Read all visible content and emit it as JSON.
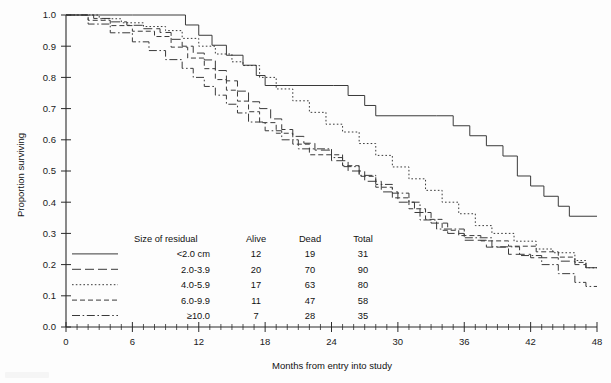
{
  "chart_data": {
    "type": "line",
    "subtype": "kaplan-meier-step",
    "title": "",
    "xlabel": "Months from entry into study",
    "ylabel": "Proportion surviving",
    "xlim": [
      0,
      48
    ],
    "ylim": [
      0.0,
      1.0
    ],
    "xticks": [
      0,
      6,
      12,
      18,
      24,
      30,
      36,
      42,
      48
    ],
    "xtick_labels": [
      "0",
      "6",
      "12",
      "18",
      "24",
      "30",
      "36",
      "42",
      "48"
    ],
    "x_minor_tick_step": 1,
    "yticks": [
      0.0,
      0.1,
      0.2,
      0.3,
      0.4,
      0.5,
      0.6,
      0.7,
      0.8,
      0.9,
      1.0
    ],
    "ytick_labels": [
      "0.0",
      "0.1",
      "0.2",
      "0.3",
      "0.4",
      "0.5",
      "0.6",
      "0.7",
      "0.8",
      "0.9",
      "1.0"
    ],
    "grid": false,
    "legend_position": "inside-lower-left",
    "line_color": "#3a3a3a",
    "background": "#fdfdfd",
    "series": [
      {
        "name": "<2.0 cm",
        "style": "solid",
        "dash": "none",
        "final_value": 0.35,
        "points": [
          [
            0,
            1.0
          ],
          [
            6.0,
            1.0
          ],
          [
            10.8,
            0.968
          ],
          [
            12.0,
            0.935
          ],
          [
            13.2,
            0.903
          ],
          [
            14.5,
            0.871
          ],
          [
            16.0,
            0.839
          ],
          [
            17.2,
            0.806
          ],
          [
            18.0,
            0.774
          ],
          [
            24.2,
            0.774
          ],
          [
            25.5,
            0.742
          ],
          [
            27.0,
            0.71
          ],
          [
            28.0,
            0.677
          ],
          [
            33.5,
            0.677
          ],
          [
            35.0,
            0.645
          ],
          [
            36.5,
            0.613
          ],
          [
            38.0,
            0.581
          ],
          [
            39.5,
            0.548
          ],
          [
            40.8,
            0.484
          ],
          [
            42.0,
            0.452
          ],
          [
            43.2,
            0.419
          ],
          [
            44.5,
            0.387
          ],
          [
            45.5,
            0.355
          ],
          [
            48,
            0.355
          ]
        ]
      },
      {
        "name": "2.0-3.9",
        "style": "long-dash",
        "dash": "9,4",
        "final_value": 0.19,
        "points": [
          [
            0,
            1.0
          ],
          [
            2.5,
            0.989
          ],
          [
            4.0,
            0.978
          ],
          [
            5.5,
            0.967
          ],
          [
            7.0,
            0.956
          ],
          [
            8.5,
            0.944
          ],
          [
            9.5,
            0.922
          ],
          [
            10.5,
            0.9
          ],
          [
            11.5,
            0.878
          ],
          [
            12.5,
            0.856
          ],
          [
            13.5,
            0.822
          ],
          [
            14.5,
            0.789
          ],
          [
            15.5,
            0.756
          ],
          [
            16.5,
            0.722
          ],
          [
            17.5,
            0.7
          ],
          [
            18.5,
            0.667
          ],
          [
            19.5,
            0.633
          ],
          [
            20.5,
            0.611
          ],
          [
            21.5,
            0.589
          ],
          [
            22.5,
            0.567
          ],
          [
            24.0,
            0.533
          ],
          [
            25.5,
            0.5
          ],
          [
            27.0,
            0.467
          ],
          [
            28.5,
            0.433
          ],
          [
            30.0,
            0.4
          ],
          [
            31.5,
            0.367
          ],
          [
            33.0,
            0.333
          ],
          [
            34.5,
            0.3
          ],
          [
            36.0,
            0.278
          ],
          [
            38.0,
            0.256
          ],
          [
            40.0,
            0.233
          ],
          [
            42.0,
            0.222
          ],
          [
            44.5,
            0.211
          ],
          [
            46.0,
            0.2
          ],
          [
            47.0,
            0.19
          ],
          [
            48,
            0.19
          ]
        ]
      },
      {
        "name": "4.0-5.9",
        "style": "dotted",
        "dash": "1.6,2.2",
        "final_value": 0.19,
        "points": [
          [
            0,
            1.0
          ],
          [
            3.0,
            0.988
          ],
          [
            5.0,
            0.975
          ],
          [
            7.0,
            0.963
          ],
          [
            9.0,
            0.95
          ],
          [
            10.5,
            0.925
          ],
          [
            12.0,
            0.9
          ],
          [
            13.5,
            0.875
          ],
          [
            15.0,
            0.85
          ],
          [
            16.0,
            0.838
          ],
          [
            17.5,
            0.8
          ],
          [
            19.0,
            0.763
          ],
          [
            20.5,
            0.725
          ],
          [
            22.0,
            0.688
          ],
          [
            23.5,
            0.65
          ],
          [
            25.0,
            0.625
          ],
          [
            26.5,
            0.588
          ],
          [
            28.0,
            0.55
          ],
          [
            29.5,
            0.513
          ],
          [
            31.0,
            0.475
          ],
          [
            32.5,
            0.438
          ],
          [
            34.0,
            0.4
          ],
          [
            35.5,
            0.363
          ],
          [
            37.0,
            0.325
          ],
          [
            38.5,
            0.3
          ],
          [
            40.5,
            0.275
          ],
          [
            42.5,
            0.25
          ],
          [
            44.0,
            0.238
          ],
          [
            46.0,
            0.213
          ],
          [
            47.0,
            0.19
          ],
          [
            48,
            0.19
          ]
        ]
      },
      {
        "name": "6.0-9.9",
        "style": "medium-dash",
        "dash": "5,3",
        "final_value": 0.19,
        "points": [
          [
            0,
            1.0
          ],
          [
            2.0,
            0.983
          ],
          [
            4.0,
            0.966
          ],
          [
            6.0,
            0.948
          ],
          [
            8.0,
            0.931
          ],
          [
            9.5,
            0.897
          ],
          [
            11.0,
            0.862
          ],
          [
            12.5,
            0.828
          ],
          [
            13.5,
            0.793
          ],
          [
            14.5,
            0.759
          ],
          [
            15.5,
            0.724
          ],
          [
            16.5,
            0.69
          ],
          [
            17.5,
            0.655
          ],
          [
            19.0,
            0.621
          ],
          [
            20.5,
            0.586
          ],
          [
            22.0,
            0.552
          ],
          [
            23.5,
            0.552
          ],
          [
            25.0,
            0.517
          ],
          [
            26.5,
            0.483
          ],
          [
            28.0,
            0.448
          ],
          [
            29.5,
            0.414
          ],
          [
            31.0,
            0.379
          ],
          [
            32.5,
            0.345
          ],
          [
            34.0,
            0.31
          ],
          [
            35.5,
            0.293
          ],
          [
            37.5,
            0.276
          ],
          [
            40.0,
            0.259
          ],
          [
            42.5,
            0.241
          ],
          [
            44.5,
            0.224
          ],
          [
            46.0,
            0.207
          ],
          [
            47.0,
            0.19
          ],
          [
            48,
            0.19
          ]
        ]
      },
      {
        "name": "≥10.0",
        "style": "dash-dot",
        "dash": "8,2.6,1.6,2.6",
        "final_value": 0.13,
        "points": [
          [
            0,
            1.0
          ],
          [
            2.0,
            0.971
          ],
          [
            4.0,
            0.943
          ],
          [
            6.0,
            0.914
          ],
          [
            7.5,
            0.886
          ],
          [
            9.0,
            0.857
          ],
          [
            10.5,
            0.829
          ],
          [
            11.5,
            0.8
          ],
          [
            12.5,
            0.771
          ],
          [
            13.5,
            0.743
          ],
          [
            14.5,
            0.714
          ],
          [
            15.5,
            0.686
          ],
          [
            16.5,
            0.657
          ],
          [
            18.0,
            0.629
          ],
          [
            19.5,
            0.6
          ],
          [
            21.0,
            0.571
          ],
          [
            22.5,
            0.571
          ],
          [
            24.0,
            0.543
          ],
          [
            25.0,
            0.514
          ],
          [
            26.5,
            0.486
          ],
          [
            28.0,
            0.457
          ],
          [
            29.5,
            0.429
          ],
          [
            31.0,
            0.4
          ],
          [
            32.0,
            0.343
          ],
          [
            33.5,
            0.314
          ],
          [
            36.0,
            0.286
          ],
          [
            38.5,
            0.257
          ],
          [
            41.0,
            0.229
          ],
          [
            43.0,
            0.2
          ],
          [
            44.5,
            0.171
          ],
          [
            46.0,
            0.143
          ],
          [
            47.0,
            0.13
          ],
          [
            48,
            0.13
          ]
        ]
      }
    ]
  },
  "legend": {
    "headers": [
      "Size of residual",
      "Alive",
      "Dead",
      "Total"
    ],
    "rows": [
      {
        "label": "<2.0 cm",
        "alive": "12",
        "dead": "19",
        "total": "31",
        "style": "solid",
        "dash": "none"
      },
      {
        "label": "2.0-3.9",
        "alive": "20",
        "dead": "70",
        "total": "90",
        "style": "long-dash",
        "dash": "9,4"
      },
      {
        "label": "4.0-5.9",
        "alive": "17",
        "dead": "63",
        "total": "80",
        "style": "dotted",
        "dash": "1.6,2.2"
      },
      {
        "label": "6.0-9.9",
        "alive": "11",
        "dead": "47",
        "total": "58",
        "style": "medium-dash",
        "dash": "5,3"
      },
      {
        "label": "≥10.0",
        "alive": "7",
        "dead": "28",
        "total": "35",
        "style": "dash-dot",
        "dash": "8,2.6,1.6,2.6"
      }
    ]
  }
}
